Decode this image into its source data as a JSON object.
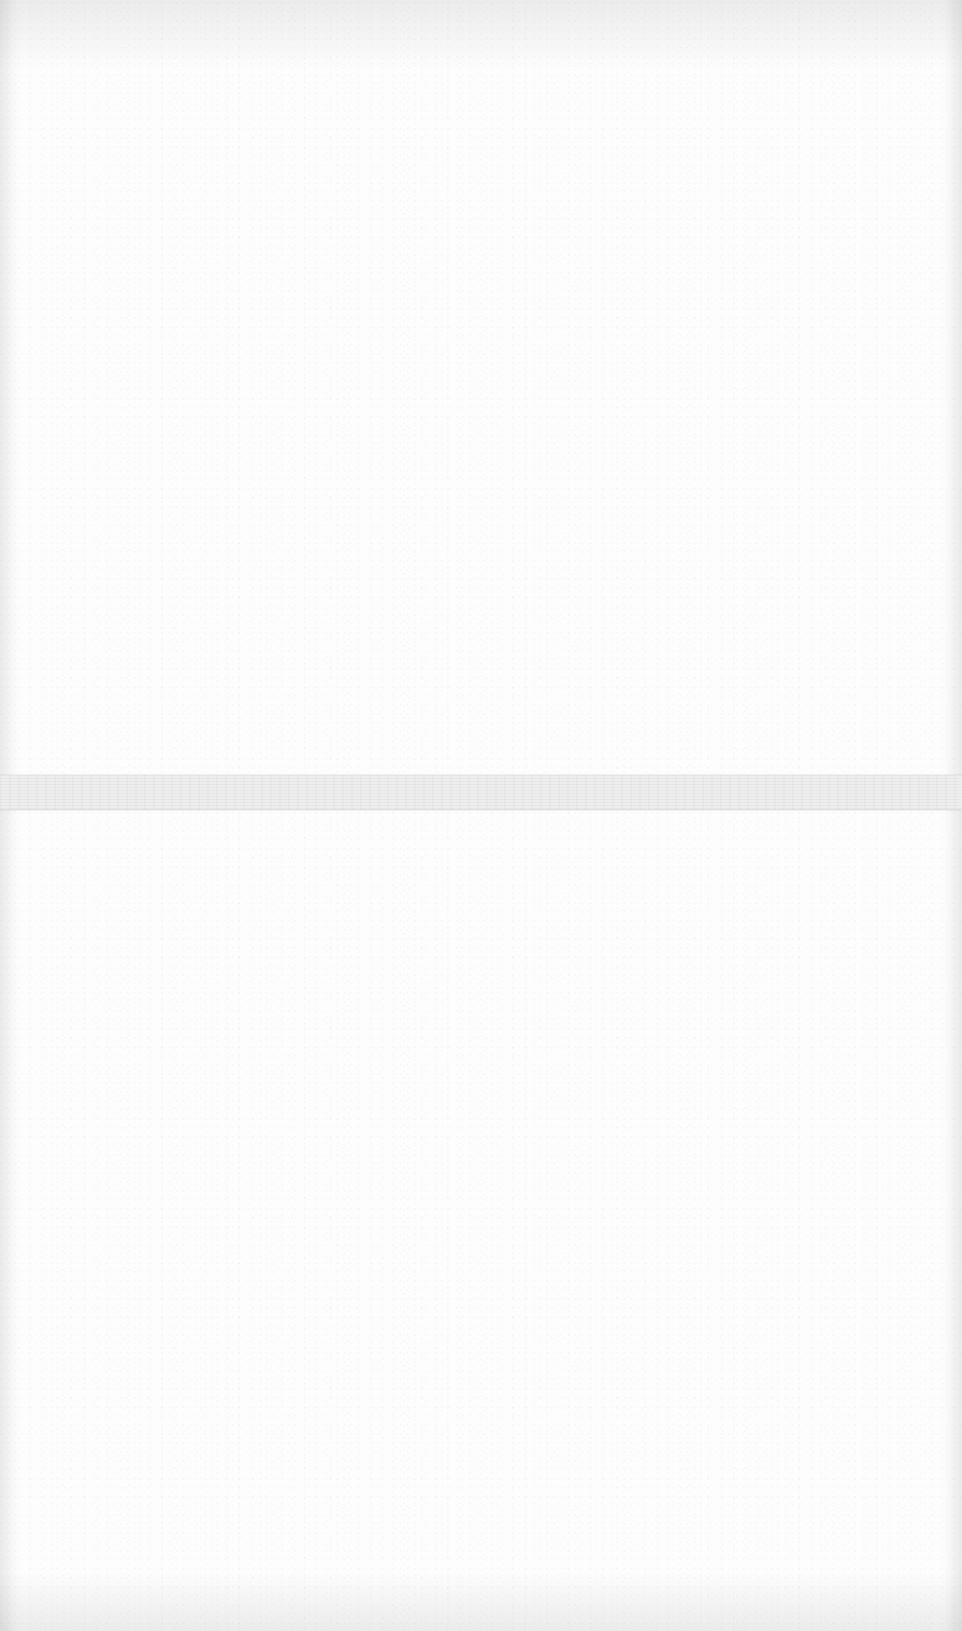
{
  "document": {
    "type": "blank scanned page",
    "background_color": "#fdfdfd",
    "band": {
      "top": 775,
      "height": 35,
      "color": "#eeeeee"
    },
    "text": []
  }
}
